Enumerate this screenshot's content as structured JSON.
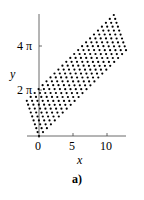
{
  "chart_data": {
    "type": "scatter",
    "title": "",
    "xlabel": "x",
    "ylabel": "y",
    "caption": "a)",
    "x_ticks": [
      "0",
      "5",
      "10"
    ],
    "y_ticks": [
      "2 π",
      "4 π"
    ],
    "xlim": [
      -2,
      13
    ],
    "ylim": [
      0,
      5.3
    ],
    "y_units": "π",
    "grid": false,
    "legend": null,
    "region_vertices": [
      [
        0,
        0
      ],
      [
        -1.8,
        1.6
      ],
      [
        11,
        5.5
      ],
      [
        12.8,
        3.9
      ]
    ],
    "region_vertices_y_units": "multiples of π"
  },
  "colors": {
    "dots": "#000000",
    "axes": "#000000",
    "background": "#ffffff"
  }
}
